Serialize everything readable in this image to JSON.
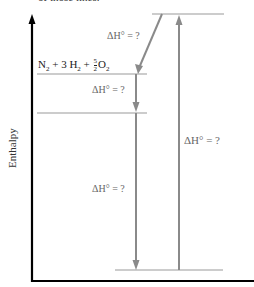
{
  "caption": "of those lines.",
  "axis": {
    "y_label": "Enthalpy"
  },
  "levels": {
    "reactants_formula": {
      "n2": "N",
      "n2_sub": "2",
      "plus1": " + 3 H",
      "h2_sub": "2",
      "plus2": " + ",
      "frac_num": "5",
      "frac_den": "2",
      "o2": "O",
      "o2_sub": "2"
    }
  },
  "labels": {
    "dh_top": "ΔH° = ?",
    "dh_mid": "ΔH° = ?",
    "dh_low": "ΔH° = ?",
    "dh_overall": "ΔH° = ?"
  },
  "colors": {
    "axis": "#000000",
    "line": "#999999",
    "arrow": "#8a8a8a"
  }
}
